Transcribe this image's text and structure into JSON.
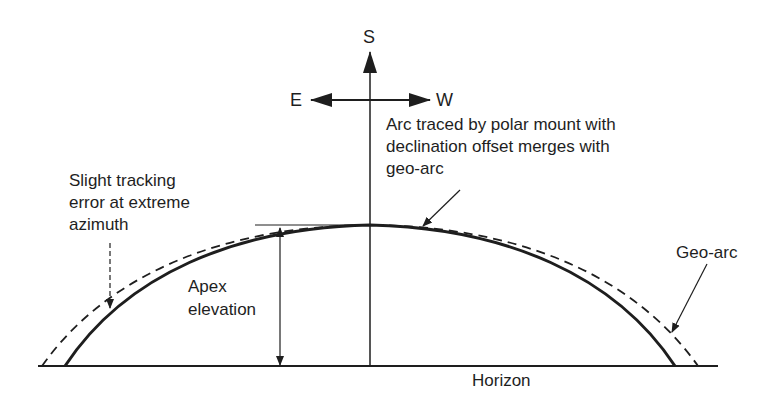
{
  "diagram": {
    "type": "geometric-arc-diagram",
    "compass": {
      "north_axis_label": "S",
      "left_label": "E",
      "right_label": "W"
    },
    "labels": {
      "polar_mount_line1": "Arc traced by polar mount with",
      "polar_mount_line2": "declination offset merges with",
      "polar_mount_line3": "geo-arc",
      "tracking_error_line1": "Slight tracking",
      "tracking_error_line2": "error at extreme",
      "tracking_error_line3": "azimuth",
      "apex_line1": "Apex",
      "apex_line2": "elevation",
      "geo_arc": "Geo-arc",
      "horizon": "Horizon"
    },
    "curves": [
      {
        "name": "polar-mount-arc",
        "style": "solid"
      },
      {
        "name": "geo-arc",
        "style": "dashed"
      }
    ],
    "colors": {
      "ink": "#1e1e1e",
      "background": "#ffffff"
    }
  }
}
